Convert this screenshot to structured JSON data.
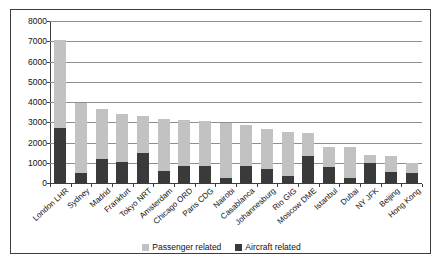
{
  "chart_data": {
    "type": "bar",
    "subtype": "stacked",
    "title": "",
    "xlabel": "",
    "ylabel": "",
    "ylim": [
      0,
      8000
    ],
    "ytick_step": 1000,
    "yticks": [
      "8000",
      "7000",
      "6000",
      "5000",
      "4000",
      "3000",
      "2000",
      "1000",
      "0"
    ],
    "grid": true,
    "legend_position": "bottom-center",
    "categories": [
      "London LHR",
      "Sydney",
      "Madrid",
      "Frankfurt",
      "Tokyo NRT",
      "Amsterdam",
      "Chicago ORD",
      "Paris CDG",
      "Nairobi",
      "Casablanca",
      "Johannesburg",
      "Rio GIG",
      "Moscow DME",
      "Istanbul",
      "Dubai",
      "NY JFK",
      "Beijing",
      "Hong Kong"
    ],
    "series": [
      {
        "name": "Aircraft related",
        "color": "#3a3a3a",
        "values": [
          2740,
          500,
          1180,
          1020,
          1490,
          580,
          850,
          860,
          240,
          850,
          710,
          370,
          1310,
          770,
          270,
          1010,
          530,
          510
        ]
      },
      {
        "name": "Passenger related",
        "color": "#c2c2c2",
        "values": [
          4340,
          3450,
          2460,
          2380,
          1800,
          2570,
          2240,
          2220,
          2730,
          2000,
          1940,
          2160,
          1160,
          1030,
          1490,
          350,
          800,
          460
        ]
      }
    ],
    "totals": [
      7080,
      3950,
      3640,
      3400,
      3290,
      3150,
      3090,
      3080,
      2970,
      2850,
      2650,
      2530,
      2470,
      1800,
      1760,
      1360,
      1330,
      970
    ]
  },
  "legend": {
    "items": [
      {
        "label": "Passenger related",
        "color": "#c2c2c2"
      },
      {
        "label": "Aircraft related",
        "color": "#3a3a3a"
      }
    ]
  }
}
